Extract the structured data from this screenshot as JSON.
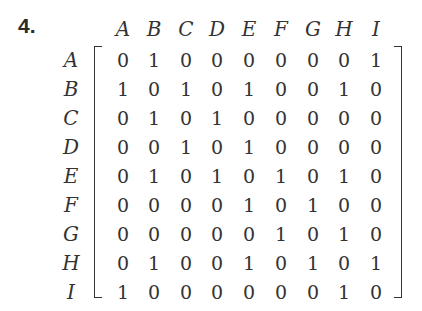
{
  "problem_number": "4.",
  "matrix": {
    "column_labels": [
      "A",
      "B",
      "C",
      "D",
      "E",
      "F",
      "G",
      "H",
      "I"
    ],
    "row_labels": [
      "A",
      "B",
      "C",
      "D",
      "E",
      "F",
      "G",
      "H",
      "I"
    ],
    "rows": [
      [
        "0",
        "1",
        "0",
        "0",
        "0",
        "0",
        "0",
        "0",
        "1"
      ],
      [
        "1",
        "0",
        "1",
        "0",
        "1",
        "0",
        "0",
        "1",
        "0"
      ],
      [
        "0",
        "1",
        "0",
        "1",
        "0",
        "0",
        "0",
        "0",
        "0"
      ],
      [
        "0",
        "0",
        "1",
        "0",
        "1",
        "0",
        "0",
        "0",
        "0"
      ],
      [
        "0",
        "1",
        "0",
        "1",
        "0",
        "1",
        "0",
        "1",
        "0"
      ],
      [
        "0",
        "0",
        "0",
        "0",
        "1",
        "0",
        "1",
        "0",
        "0"
      ],
      [
        "0",
        "0",
        "0",
        "0",
        "0",
        "1",
        "0",
        "1",
        "0"
      ],
      [
        "0",
        "1",
        "0",
        "0",
        "1",
        "0",
        "1",
        "0",
        "1"
      ],
      [
        "1",
        "0",
        "0",
        "0",
        "0",
        "0",
        "0",
        "1",
        "0"
      ]
    ]
  }
}
